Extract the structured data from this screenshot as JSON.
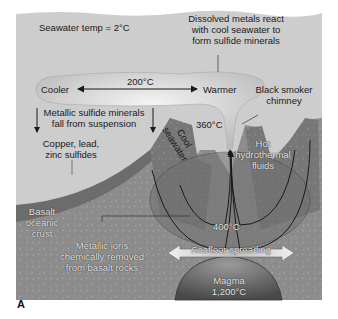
{
  "figure": {
    "panel_letter": "A",
    "labels": {
      "seawater_temp": "Seawater temp = 2°C",
      "dissolved_metals": [
        "Dissolved metals react",
        "with cool seawater to",
        "form sulfide minerals"
      ],
      "cooler": "Cooler",
      "warmer": "Warmer",
      "plume_temp": "200°C",
      "black_smoker": [
        "Black smoker",
        "chimney"
      ],
      "vent_temp": "360°C",
      "metallic_sulfide_fall": [
        "Metallic sulfide minerals",
        "fall from suspension"
      ],
      "sulfides": [
        "Copper, lead,",
        "zinc sulfides"
      ],
      "cool_seawater": [
        "Cool",
        "seawater"
      ],
      "hot_fluids": [
        "Hot",
        "hydrothermal",
        "fluids"
      ],
      "basalt_crust": [
        "Basalt",
        "oceanic",
        "crust"
      ],
      "deep_temp": "400°C",
      "metallic_ions": [
        "Metallic ions",
        "chemically removed",
        "from basalt rocks"
      ],
      "seafloor_spreading": "Seafloor spreading",
      "magma": [
        "Magma",
        "1,200°C"
      ]
    },
    "colors": {
      "seawater": "#cfcfcf",
      "crust": "#8a8a8a",
      "sediment": "#6e6e6e",
      "ridge": "#7d7d7d",
      "magma": "#5a5a5a",
      "plume": "#e6e6e6",
      "arrow": "#1a1a1a"
    }
  }
}
